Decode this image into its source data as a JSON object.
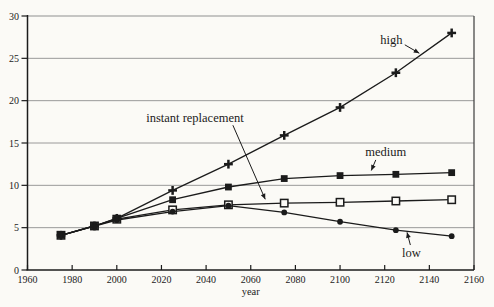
{
  "figure": {
    "background": "#fbfaf6",
    "ink": "#1b1b1b",
    "grid_color": "#8f8f8f",
    "border_color": "#3c3c3c"
  },
  "chart_data": {
    "type": "line",
    "title": "",
    "subtitle": "",
    "xlabel": "year",
    "ylabel": "",
    "xlim": [
      1960,
      2160
    ],
    "ylim": [
      0,
      30
    ],
    "x_ticks": [
      1960,
      1980,
      2000,
      2020,
      2040,
      2060,
      2080,
      2100,
      2120,
      2140,
      2160
    ],
    "y_ticks": [
      0,
      5,
      10,
      15,
      20,
      25,
      30
    ],
    "grid": "horizontal",
    "legend_position": "inline-annotations",
    "x": [
      1975,
      1990,
      2000,
      2025,
      2050,
      2075,
      2100,
      2125,
      2150
    ],
    "series": [
      {
        "name": "instant replacement",
        "marker": "open-square",
        "values": [
          4.1,
          5.2,
          6.0,
          7.1,
          7.7,
          7.9,
          8.0,
          8.15,
          8.3
        ]
      },
      {
        "name": "low",
        "marker": "filled-circle",
        "values": [
          4.1,
          5.2,
          5.9,
          6.9,
          7.6,
          6.8,
          5.7,
          4.7,
          4.0
        ]
      },
      {
        "name": "medium",
        "marker": "filled-square",
        "values": [
          4.1,
          5.2,
          6.1,
          8.3,
          9.8,
          10.8,
          11.15,
          11.3,
          11.5
        ]
      },
      {
        "name": "high",
        "marker": "bold-plus",
        "values": [
          4.1,
          5.2,
          6.1,
          9.4,
          12.5,
          15.9,
          19.2,
          23.3,
          28.0
        ]
      }
    ],
    "annotations": [
      {
        "text": "high",
        "tx": 2123,
        "ty": 27.2,
        "arrow": {
          "x1": 2129,
          "y1": 26.6,
          "x2": 2135.5,
          "y2": 25.6
        }
      },
      {
        "text": "medium",
        "tx": 2120.5,
        "ty": 13.9,
        "arrow": {
          "x1": 2116,
          "y1": 13.0,
          "x2": 2114,
          "y2": 11.75
        }
      },
      {
        "text": "instant replacement",
        "tx": 2035,
        "ty": 17.9,
        "arrow": {
          "x1": 2052,
          "y1": 17.1,
          "x2": 2066.5,
          "y2": 8.35
        }
      },
      {
        "text": "low",
        "tx": 2132,
        "ty": 2.0,
        "arrow": {
          "x1": 2131.5,
          "y1": 2.95,
          "x2": 2130,
          "y2": 4.45
        }
      }
    ]
  }
}
